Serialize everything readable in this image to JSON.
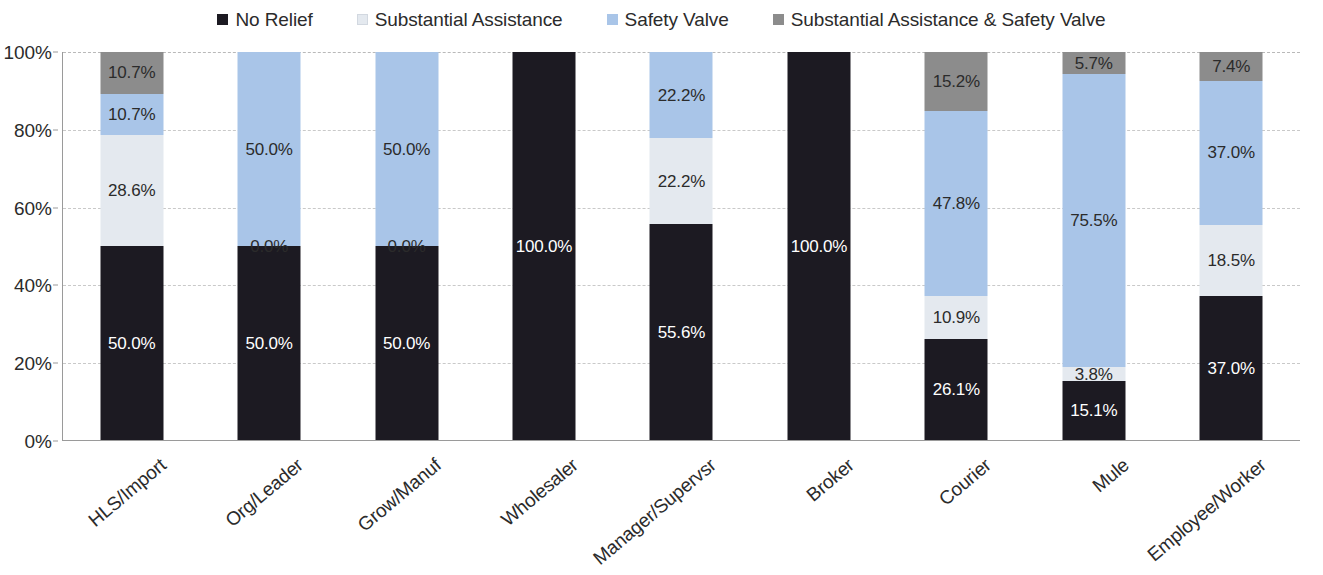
{
  "chart_data": {
    "type": "bar",
    "stacked": true,
    "stack_mode": "percent",
    "title": "",
    "subtitle": "",
    "xlabel": "",
    "ylabel": "",
    "ylim": [
      0,
      100
    ],
    "ytick_labels": [
      "100%",
      "80%",
      "60%",
      "40%",
      "20%",
      "0%"
    ],
    "ytick_values": [
      100,
      80,
      60,
      40,
      20,
      0
    ],
    "grid": true,
    "grid_axis": "y",
    "legend_position": "top",
    "categories": [
      "HLS/Import",
      "Org/Leader",
      "Grow/Manuf",
      "Wholesaler",
      "Manager/Supervsr",
      "Broker",
      "Courier",
      "Mule",
      "Employee/Worker"
    ],
    "series": [
      {
        "name": "No Relief",
        "color": "#1c1a22",
        "label_color": "#ffffff",
        "values": [
          50.0,
          50.0,
          50.0,
          100.0,
          55.6,
          100.0,
          26.1,
          15.1,
          37.0
        ],
        "labels": [
          "50.0%",
          "50.0%",
          "50.0%",
          "100.0%",
          "55.6%",
          "100.0%",
          "26.1%",
          "15.1%",
          "37.0%"
        ]
      },
      {
        "name": "Substantial Assistance",
        "color": "#e4e9ef",
        "label_color": "#2b2b2b",
        "values": [
          28.6,
          0.0,
          0.0,
          0.0,
          22.2,
          0.0,
          10.9,
          3.8,
          18.5
        ],
        "labels": [
          "28.6%",
          "0.0%",
          "0.0%",
          "",
          "22.2%",
          "",
          "10.9%",
          "3.8%",
          "18.5%"
        ]
      },
      {
        "name": "Safety Valve",
        "color": "#a9c5e8",
        "label_color": "#2b2b2b",
        "values": [
          10.7,
          50.0,
          50.0,
          0.0,
          22.2,
          0.0,
          47.8,
          75.5,
          37.0
        ],
        "labels": [
          "10.7%",
          "50.0%",
          "50.0%",
          "",
          "22.2%",
          "",
          "47.8%",
          "75.5%",
          "37.0%"
        ]
      },
      {
        "name": "Substantial Assistance & Safety Valve",
        "color": "#8c8c8c",
        "label_color": "#2b2b2b",
        "values": [
          10.7,
          0.0,
          0.0,
          0.0,
          0.0,
          0.0,
          15.2,
          5.7,
          7.4
        ],
        "labels": [
          "10.7%",
          "",
          "",
          "",
          "",
          "",
          "15.2%",
          "5.7%",
          "7.4%"
        ]
      }
    ]
  },
  "legend": {
    "items": [
      {
        "label": "No Relief",
        "color": "#1c1a22"
      },
      {
        "label": "Substantial Assistance",
        "color": "#e4e9ef"
      },
      {
        "label": "Safety Valve",
        "color": "#a9c5e8"
      },
      {
        "label": "Substantial Assistance & Safety Valve",
        "color": "#8c8c8c"
      }
    ]
  },
  "axes": {
    "y": {
      "ticks": [
        "100%",
        "80%",
        "60%",
        "40%",
        "20%",
        "0%"
      ]
    },
    "x": {
      "ticks": [
        "HLS/Import",
        "Org/Leader",
        "Grow/Manuf",
        "Wholesaler",
        "Manager/Supervsr",
        "Broker",
        "Courier",
        "Mule",
        "Employee/Worker"
      ]
    }
  }
}
